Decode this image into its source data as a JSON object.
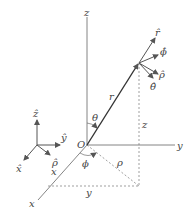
{
  "diagram": {
    "colors": {
      "line": "#555555",
      "vector": "#333333",
      "dashed": "#666666",
      "text": "#444444"
    },
    "axes": {
      "x": "x",
      "y": "y",
      "z": "z"
    },
    "origin": "O",
    "labels": {
      "r": "r",
      "theta": "θ",
      "phi": "ϕ",
      "rho": "ρ",
      "z_len": "z",
      "x_len": "x",
      "y_len": "y"
    },
    "unit_vectors_point": {
      "r_hat": "r̂",
      "phi_hat": "ϕ̂",
      "rho_hat": "ρ̂",
      "theta_hat": "θ̂"
    },
    "unit_vectors_legend": {
      "z_hat": "ẑ",
      "y_hat": "ŷ",
      "x_hat": "x̂",
      "rho_hat": "ρ̂"
    }
  }
}
